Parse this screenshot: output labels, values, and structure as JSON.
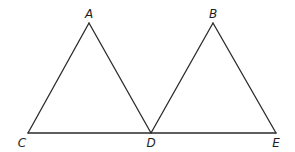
{
  "diagram": {
    "type": "geometry",
    "points": {
      "A": {
        "label": "A",
        "x": 89,
        "y": 23,
        "lx": 89,
        "ly": 18
      },
      "B": {
        "label": "B",
        "x": 213,
        "y": 23,
        "lx": 213,
        "ly": 18
      },
      "C": {
        "label": "C",
        "x": 28,
        "y": 133,
        "lx": 22,
        "ly": 147
      },
      "D": {
        "label": "D",
        "x": 151,
        "y": 133,
        "lx": 151,
        "ly": 147
      },
      "E": {
        "label": "E",
        "x": 276,
        "y": 133,
        "lx": 276,
        "ly": 147
      }
    },
    "segments": [
      [
        "A",
        "C"
      ],
      [
        "A",
        "D"
      ],
      [
        "B",
        "D"
      ],
      [
        "B",
        "E"
      ],
      [
        "C",
        "E"
      ]
    ],
    "triangles": [
      "ACD",
      "BDE"
    ],
    "stroke_color": "#2b2b2b"
  }
}
